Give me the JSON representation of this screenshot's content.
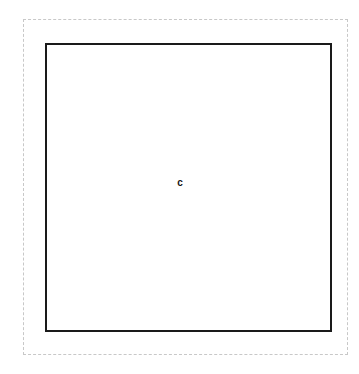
{
  "figure": {
    "background_color": "#ffffff",
    "width": 359,
    "height": 374,
    "bounding_box": {
      "name": "outer-dashed-boundary",
      "style": "dashed",
      "color": "#c8c8c8",
      "stroke_width": 1,
      "x": 23,
      "y": 19,
      "width": 325,
      "height": 336
    },
    "shapes": [
      {
        "name": "square-outline",
        "style": "solid",
        "color": "#1a1a1a",
        "fill": "#ffffff",
        "stroke_width": 2,
        "x": 45,
        "y": 43,
        "width": 287,
        "height": 289
      }
    ],
    "labels": [
      {
        "name": "center-label",
        "text": "c",
        "x": 180,
        "y": 183,
        "color": "#141414",
        "font_size": 10,
        "font_weight": "bold"
      }
    ]
  }
}
